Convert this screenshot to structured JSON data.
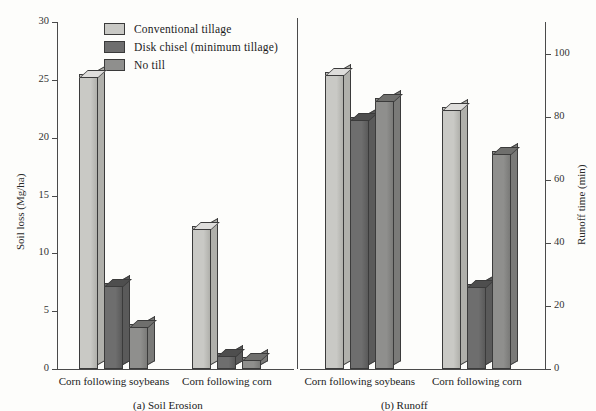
{
  "chart_data": {
    "type": "bar",
    "title": "",
    "panels": [
      {
        "id": "a",
        "caption": "(a)  Soil Erosion",
        "ylabel": "Soil loss (Mg/ha)",
        "ylim": [
          0,
          30
        ],
        "yticks": [
          0,
          5,
          10,
          15,
          20,
          25,
          30
        ],
        "axis_side": "left",
        "categories": [
          "Corn following soybeans",
          "Corn following corn"
        ],
        "series": [
          {
            "name": "Conventional tillage",
            "values": [
              25.5,
              12.4
            ]
          },
          {
            "name": "Disk chisel (minimum  tillage)",
            "values": [
              7.4,
              1.4
            ]
          },
          {
            "name": "No till",
            "values": [
              3.9,
              1.0
            ]
          }
        ]
      },
      {
        "id": "b",
        "caption": "(b)  Runoff",
        "ylabel": "Runoff time (min)",
        "ylim": [
          0,
          110
        ],
        "yticks": [
          0,
          20,
          40,
          60,
          80,
          100
        ],
        "axis_side": "right",
        "categories": [
          "Corn following soybeans",
          "Corn following corn"
        ],
        "series": [
          {
            "name": "Conventional tillage",
            "values": [
              94,
              83
            ]
          },
          {
            "name": "Disk chisel (minimum  tillage)",
            "values": [
              80,
              27
            ]
          },
          {
            "name": "No till",
            "values": [
              86,
              69
            ]
          }
        ]
      }
    ],
    "legend": {
      "position": "top-left",
      "entries": [
        {
          "label": "Conventional tillage",
          "color": "#c9c9c5",
          "top": "#dedddb",
          "side": "#b0b0ab"
        },
        {
          "label": "Disk chisel (minimum  tillage)",
          "color": "#6e6e6e",
          "top": "#4e4e4e",
          "side": "#5a5a5a"
        },
        {
          "label": "No till",
          "color": "#8f8f8d",
          "top": "#6f6f6d",
          "side": "#7a7a78"
        }
      ]
    },
    "grid": false,
    "background": "#fdfdfb"
  },
  "corner": {
    "mark": ""
  }
}
